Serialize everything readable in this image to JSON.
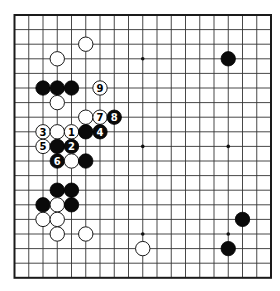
{
  "board": {
    "size": 19,
    "origin_x": 14.5,
    "origin_y": 15,
    "spacing_x": 14.25,
    "spacing_y": 14.6,
    "stone_radius": 7.2,
    "colors": {
      "background": "#ffffff",
      "line": "#333333",
      "black": "#0a0a0a",
      "white": "#ffffff"
    },
    "star_points": [
      [
        3,
        3
      ],
      [
        9,
        3
      ],
      [
        15,
        3
      ],
      [
        3,
        9
      ],
      [
        9,
        9
      ],
      [
        15,
        9
      ],
      [
        3,
        15
      ],
      [
        9,
        15
      ],
      [
        15,
        15
      ]
    ]
  },
  "stones": [
    {
      "color": "white",
      "col": 5,
      "row": 2,
      "label": ""
    },
    {
      "color": "white",
      "col": 3,
      "row": 3,
      "label": ""
    },
    {
      "color": "black",
      "col": 15,
      "row": 3,
      "label": ""
    },
    {
      "color": "black",
      "col": 2,
      "row": 5,
      "label": ""
    },
    {
      "color": "black",
      "col": 3,
      "row": 5,
      "label": ""
    },
    {
      "color": "black",
      "col": 4,
      "row": 5,
      "label": ""
    },
    {
      "color": "white",
      "col": 6,
      "row": 5,
      "label": "9"
    },
    {
      "color": "white",
      "col": 3,
      "row": 6,
      "label": ""
    },
    {
      "color": "white",
      "col": 5,
      "row": 7,
      "label": ""
    },
    {
      "color": "white",
      "col": 6,
      "row": 7,
      "label": "7"
    },
    {
      "color": "black",
      "col": 7,
      "row": 7,
      "label": "8"
    },
    {
      "color": "white",
      "col": 2,
      "row": 8,
      "label": "3"
    },
    {
      "color": "white",
      "col": 3,
      "row": 8,
      "label": ""
    },
    {
      "color": "white",
      "col": 4,
      "row": 8,
      "label": "1"
    },
    {
      "color": "black",
      "col": 5,
      "row": 8,
      "label": ""
    },
    {
      "color": "black",
      "col": 6,
      "row": 8,
      "label": "4"
    },
    {
      "color": "white",
      "col": 2,
      "row": 9,
      "label": "5"
    },
    {
      "color": "black",
      "col": 3,
      "row": 9,
      "label": ""
    },
    {
      "color": "black",
      "col": 4,
      "row": 9,
      "label": "2"
    },
    {
      "color": "black",
      "col": 3,
      "row": 10,
      "label": "6"
    },
    {
      "color": "white",
      "col": 4,
      "row": 10,
      "label": ""
    },
    {
      "color": "black",
      "col": 5,
      "row": 10,
      "label": ""
    },
    {
      "color": "black",
      "col": 3,
      "row": 12,
      "label": ""
    },
    {
      "color": "black",
      "col": 4,
      "row": 12,
      "label": ""
    },
    {
      "color": "black",
      "col": 2,
      "row": 13,
      "label": ""
    },
    {
      "color": "white",
      "col": 3,
      "row": 13,
      "label": ""
    },
    {
      "color": "black",
      "col": 4,
      "row": 13,
      "label": ""
    },
    {
      "color": "white",
      "col": 2,
      "row": 14,
      "label": ""
    },
    {
      "color": "white",
      "col": 3,
      "row": 14,
      "label": ""
    },
    {
      "color": "black",
      "col": 16,
      "row": 14,
      "label": ""
    },
    {
      "color": "white",
      "col": 3,
      "row": 15,
      "label": ""
    },
    {
      "color": "white",
      "col": 5,
      "row": 15,
      "label": ""
    },
    {
      "color": "white",
      "col": 9,
      "row": 16,
      "label": ""
    },
    {
      "color": "black",
      "col": 15,
      "row": 16,
      "label": ""
    }
  ]
}
